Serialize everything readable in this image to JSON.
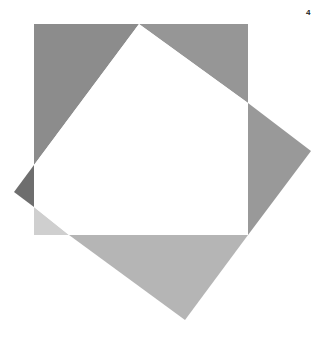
{
  "page_number": "4",
  "figure": {
    "square": {
      "x": 34,
      "y": 24,
      "width": 214,
      "height": 211
    },
    "tilted_square_vertices": [
      [
        139,
        24
      ],
      [
        311,
        151
      ],
      [
        185,
        320
      ],
      [
        14,
        192
      ]
    ],
    "regions": [
      {
        "name": "top-left-triangle",
        "points": "34,24 139,24 34,165",
        "color": "#8c8c8c"
      },
      {
        "name": "top-right-triangle",
        "points": "139,24 248,24 248,103",
        "color": "#969696"
      },
      {
        "name": "right-triangle",
        "points": "248,103 311,151 248,235",
        "color": "#999999"
      },
      {
        "name": "bottom-triangle",
        "points": "69,235 248,235 185,320",
        "color": "#b5b5b5"
      },
      {
        "name": "left-dark-triangle",
        "points": "34,165 14,192 34,207",
        "color": "#6e6e6e"
      },
      {
        "name": "bottom-left-light-triangle",
        "points": "34,207 69,235 34,235",
        "color": "#cfcfcf"
      },
      {
        "name": "center-white-overlap",
        "points": "139,24 248,103 248,235 69,235 34,207 34,165",
        "color": "#ffffff"
      }
    ]
  }
}
